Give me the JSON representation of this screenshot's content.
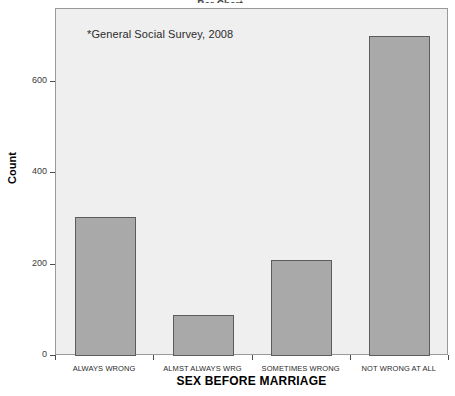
{
  "chart_data": {
    "type": "bar",
    "title": "SEX BEFORE MARRIAGE",
    "categories": [
      "ALWAYS WRONG",
      "ALMST ALWAYS WRG",
      "SOMETIMES WRONG",
      "NOT WRONG AT ALL"
    ],
    "values": [
      305,
      90,
      210,
      700
    ],
    "xlabel": "SEX BEFORE MARRIAGE",
    "ylabel": "Count",
    "ylim": [
      0,
      760
    ],
    "yticks": [
      0,
      200,
      400,
      600
    ],
    "ytick_labels": [
      "0",
      "200",
      "400",
      "600"
    ],
    "grid": false,
    "legend": false,
    "annotations": [
      "*General Social Survey, 2008"
    ],
    "bar_fill_color": "#a9a9a9",
    "bar_border_color": "#5c5c5c",
    "plot_background_color": "#efefef"
  },
  "annotation": {
    "text": "*General Social Survey, 2008"
  },
  "axes": {
    "y_title": "Count",
    "x_title": "SEX BEFORE MARRIAGE"
  },
  "title_sliver": {
    "text": "Bar Chart"
  }
}
